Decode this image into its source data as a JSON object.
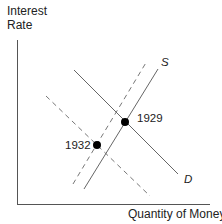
{
  "diagram": {
    "y_axis_label_line1": "Interest",
    "y_axis_label_line2": "Rate",
    "x_axis_label": "Quantity of Money",
    "curves": [
      {
        "name": "S",
        "style": "solid",
        "label": "S"
      },
      {
        "name": "D",
        "style": "solid",
        "label": "D"
      },
      {
        "name": "S-shifted",
        "style": "dashed",
        "label": ""
      },
      {
        "name": "D-shifted",
        "style": "dashed",
        "label": ""
      }
    ],
    "points": [
      {
        "label": "1929",
        "description": "equilibrium of solid S and D"
      },
      {
        "label": "1932",
        "description": "equilibrium of dashed S and D"
      }
    ],
    "colors": {
      "axis": "#555555",
      "line": "#666666",
      "dashed": "#777777",
      "point": "#000000"
    }
  }
}
